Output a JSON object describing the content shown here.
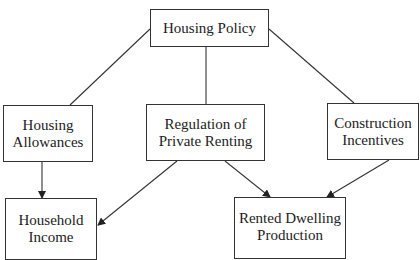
{
  "diagram": {
    "nodes": [
      {
        "id": "housing-policy",
        "label": "Housing Policy"
      },
      {
        "id": "housing-allowances",
        "label": "Housing\nAllowances"
      },
      {
        "id": "regulation",
        "label": "Regulation of\nPrivate Renting"
      },
      {
        "id": "construction",
        "label": "Construction\nIncentives"
      },
      {
        "id": "household-income",
        "label": "Household\nIncome"
      },
      {
        "id": "rented-dwelling",
        "label": "Rented Dwelling\nProduction"
      }
    ],
    "edges": [
      {
        "from": "housing-policy",
        "to": "housing-allowances",
        "arrow": false
      },
      {
        "from": "housing-policy",
        "to": "regulation",
        "arrow": false
      },
      {
        "from": "housing-policy",
        "to": "construction",
        "arrow": false
      },
      {
        "from": "housing-allowances",
        "to": "household-income",
        "arrow": true
      },
      {
        "from": "regulation",
        "to": "household-income",
        "arrow": true
      },
      {
        "from": "regulation",
        "to": "rented-dwelling",
        "arrow": true
      },
      {
        "from": "construction",
        "to": "rented-dwelling",
        "arrow": true
      }
    ]
  }
}
